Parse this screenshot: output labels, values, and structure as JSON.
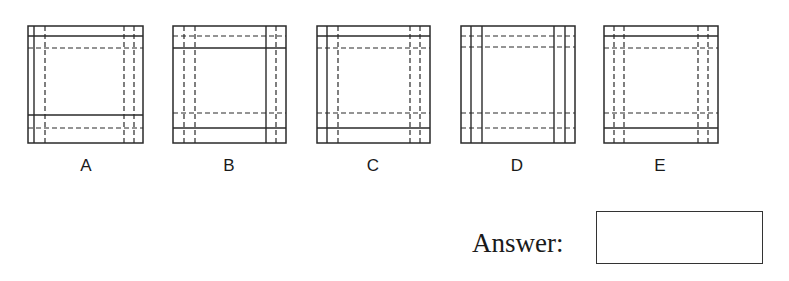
{
  "question": {
    "options": [
      {
        "label": "A",
        "box": {
          "x": 28,
          "y": 26,
          "w": 115,
          "h": 117
        },
        "vertical": [
          {
            "offset": 6,
            "style": "solid"
          },
          {
            "offset": 17,
            "style": "dashed"
          },
          {
            "offset": 96,
            "style": "dashed"
          },
          {
            "offset": 106,
            "style": "dashed"
          }
        ],
        "horizontal": [
          {
            "offset": 10,
            "style": "solid"
          },
          {
            "offset": 22,
            "style": "dashed"
          },
          {
            "offset": 89,
            "style": "solid"
          },
          {
            "offset": 102,
            "style": "dashed"
          }
        ]
      },
      {
        "label": "B",
        "box": {
          "x": 173,
          "y": 26,
          "w": 113,
          "h": 117
        },
        "vertical": [
          {
            "offset": 11,
            "style": "dashed"
          },
          {
            "offset": 22,
            "style": "dashed"
          },
          {
            "offset": 93,
            "style": "solid"
          },
          {
            "offset": 103,
            "style": "dashed"
          }
        ],
        "horizontal": [
          {
            "offset": 10,
            "style": "dashed"
          },
          {
            "offset": 22,
            "style": "solid"
          },
          {
            "offset": 87,
            "style": "dashed"
          },
          {
            "offset": 102,
            "style": "solid"
          }
        ]
      },
      {
        "label": "C",
        "box": {
          "x": 317,
          "y": 26,
          "w": 113,
          "h": 117
        },
        "vertical": [
          {
            "offset": 10,
            "style": "solid"
          },
          {
            "offset": 21,
            "style": "dashed"
          },
          {
            "offset": 93,
            "style": "dashed"
          },
          {
            "offset": 103,
            "style": "dashed"
          }
        ],
        "horizontal": [
          {
            "offset": 10,
            "style": "solid"
          },
          {
            "offset": 22,
            "style": "dashed"
          },
          {
            "offset": 87,
            "style": "dashed"
          },
          {
            "offset": 102,
            "style": "solid"
          }
        ]
      },
      {
        "label": "D",
        "box": {
          "x": 461,
          "y": 26,
          "w": 114,
          "h": 117
        },
        "vertical": [
          {
            "offset": 10,
            "style": "solid"
          },
          {
            "offset": 21,
            "style": "solid"
          },
          {
            "offset": 93,
            "style": "solid"
          },
          {
            "offset": 104,
            "style": "solid"
          }
        ],
        "horizontal": [
          {
            "offset": 10,
            "style": "dashed"
          },
          {
            "offset": 21,
            "style": "dashed"
          },
          {
            "offset": 87,
            "style": "dashed"
          },
          {
            "offset": 102,
            "style": "dashed"
          }
        ]
      },
      {
        "label": "E",
        "box": {
          "x": 604,
          "y": 26,
          "w": 114,
          "h": 117
        },
        "vertical": [
          {
            "offset": 10,
            "style": "dashed"
          },
          {
            "offset": 20,
            "style": "dashed"
          },
          {
            "offset": 94,
            "style": "dashed"
          },
          {
            "offset": 104,
            "style": "dashed"
          }
        ],
        "horizontal": [
          {
            "offset": 10,
            "style": "solid"
          },
          {
            "offset": 22,
            "style": "dashed"
          },
          {
            "offset": 87,
            "style": "dashed"
          },
          {
            "offset": 102,
            "style": "solid"
          }
        ]
      }
    ]
  },
  "answer": {
    "label": "Answer:",
    "value": ""
  },
  "colors": {
    "line": "#2a2a2a",
    "background": "#ffffff"
  }
}
